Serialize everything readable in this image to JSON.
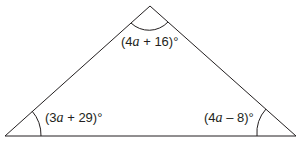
{
  "diagram": {
    "type": "triangle",
    "vertices": {
      "top": [
        150,
        6
      ],
      "bottom_left": [
        5,
        136
      ],
      "bottom_right": [
        296,
        136
      ]
    },
    "angles": {
      "top": {
        "coef": "4",
        "var": "a",
        "rest": " + 16)°",
        "text": "(4a + 16)°"
      },
      "bottom_left": {
        "coef": "3",
        "var": "a",
        "rest": " + 29)°",
        "text": "(3a + 29)°"
      },
      "bottom_right": {
        "coef": "4",
        "var": "a",
        "rest": " – 8)°",
        "text": "(4a – 8)°"
      }
    },
    "stroke_color": "#231f20"
  }
}
